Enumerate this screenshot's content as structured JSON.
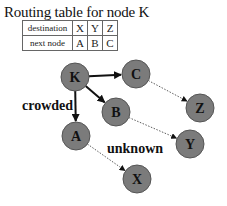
{
  "title": "Routing table for node K",
  "table": {
    "rows": [
      {
        "header": "destination",
        "cells": [
          "X",
          "Y",
          "Z"
        ]
      },
      {
        "header": "next node",
        "cells": [
          "A",
          "B",
          "C"
        ]
      }
    ]
  },
  "colors": {
    "node_fill": "#7b7b7b",
    "node_stroke": "#555555",
    "edge": "#111111",
    "dotted_edge": "#333333"
  },
  "nodes": [
    {
      "id": "K",
      "label": "K",
      "x": 75,
      "y": 77
    },
    {
      "id": "C",
      "label": "C",
      "x": 136,
      "y": 74
    },
    {
      "id": "B",
      "label": "B",
      "x": 116,
      "y": 112
    },
    {
      "id": "A",
      "label": "A",
      "x": 76,
      "y": 136
    },
    {
      "id": "Z",
      "label": "Z",
      "x": 200,
      "y": 108
    },
    {
      "id": "Y",
      "label": "Y",
      "x": 190,
      "y": 144
    },
    {
      "id": "X",
      "label": "X",
      "x": 137,
      "y": 179
    }
  ],
  "edges": [
    {
      "from": "K",
      "to": "C",
      "style": "solid"
    },
    {
      "from": "K",
      "to": "B",
      "style": "solid"
    },
    {
      "from": "K",
      "to": "A",
      "style": "solid"
    },
    {
      "from": "C",
      "to": "Z",
      "style": "dotted"
    },
    {
      "from": "B",
      "to": "Y",
      "style": "dotted"
    },
    {
      "from": "A",
      "to": "X",
      "style": "dotted"
    }
  ],
  "annotations": {
    "crowded": "crowded",
    "unknown": "unknown"
  }
}
